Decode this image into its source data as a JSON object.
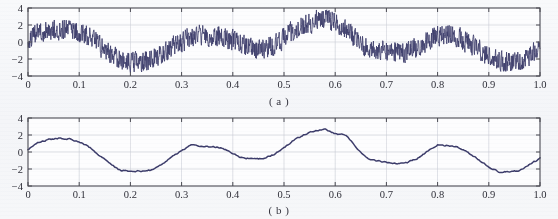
{
  "figure": {
    "background_color": "#f7f8fa",
    "line_color": "#3d3d6b",
    "grid_color": "#c9ccd4",
    "axis_color": "#4a4a52",
    "tick_label_color": "#2e2e38"
  },
  "panels": [
    {
      "id": "a",
      "caption": "( a )",
      "axes": {
        "x_ticks": [
          "0",
          "0.1",
          "0.2",
          "0.3",
          "0.4",
          "0.5",
          "0.6",
          "0.7",
          "0.8",
          "0.9",
          "1.0"
        ],
        "y_ticks": [
          "4",
          "2",
          "0",
          "-2",
          "-4"
        ],
        "xlim": [
          0,
          1
        ],
        "ylim": [
          -4,
          4
        ],
        "grid": true
      }
    },
    {
      "id": "b",
      "caption": "( b )",
      "axes": {
        "x_ticks": [
          "0",
          "0.1",
          "0.2",
          "0.3",
          "0.4",
          "0.5",
          "0.6",
          "0.7",
          "0.8",
          "0.9",
          "1.0"
        ],
        "y_ticks": [
          "4",
          "2",
          "0",
          "-2",
          "-4"
        ],
        "xlim": [
          0,
          1
        ],
        "ylim": [
          -4,
          4
        ],
        "grid": true
      }
    }
  ],
  "chart_data": [
    {
      "type": "line",
      "title": "( a )",
      "xlabel": "",
      "ylabel": "",
      "xlim": [
        0,
        1
      ],
      "ylim": [
        -4,
        4
      ],
      "grid": true,
      "legend": null,
      "xticks": [
        0,
        0.1,
        0.2,
        0.3,
        0.4,
        0.5,
        0.6,
        0.7,
        0.8,
        0.9,
        1.0
      ],
      "yticks": [
        -4,
        -2,
        0,
        2,
        4
      ],
      "series": [
        {
          "name": "noisy signal",
          "description": "Slow multi-hump oscillation with dense high-frequency noise of roughly +/-1.2 amplitude superimposed.",
          "baseline": {
            "x": [
              0.0,
              0.02,
              0.04,
              0.06,
              0.08,
              0.1,
              0.12,
              0.14,
              0.16,
              0.18,
              0.2,
              0.22,
              0.24,
              0.26,
              0.28,
              0.3,
              0.32,
              0.34,
              0.36,
              0.38,
              0.4,
              0.42,
              0.44,
              0.46,
              0.48,
              0.5,
              0.52,
              0.54,
              0.56,
              0.58,
              0.6,
              0.62,
              0.64,
              0.66,
              0.68,
              0.7,
              0.72,
              0.74,
              0.76,
              0.78,
              0.8,
              0.82,
              0.84,
              0.86,
              0.88,
              0.9,
              0.92,
              0.94,
              0.96,
              0.98,
              1.0
            ],
            "y": [
              0.35,
              1.15,
              1.45,
              1.55,
              1.6,
              1.25,
              0.55,
              -0.35,
              -1.35,
              -2.1,
              -2.3,
              -2.25,
              -2.2,
              -1.55,
              -0.7,
              0.1,
              0.6,
              0.75,
              0.7,
              0.55,
              0.15,
              -0.45,
              -0.75,
              -0.8,
              -0.4,
              0.45,
              1.35,
              2.05,
              2.45,
              2.6,
              2.35,
              1.55,
              0.35,
              -0.6,
              -0.95,
              -1.15,
              -1.3,
              -1.15,
              -0.7,
              0.1,
              0.75,
              0.85,
              0.55,
              -0.05,
              -0.85,
              -1.7,
              -2.25,
              -2.35,
              -2.15,
              -1.55,
              -0.85
            ]
          },
          "noise_amplitude": 1.2,
          "observed_min": -3.9,
          "observed_max": 3.9
        }
      ]
    },
    {
      "type": "line",
      "title": "( b )",
      "xlabel": "",
      "ylabel": "",
      "xlim": [
        0,
        1
      ],
      "ylim": [
        -4,
        4
      ],
      "grid": true,
      "legend": null,
      "xticks": [
        0,
        0.1,
        0.2,
        0.3,
        0.4,
        0.5,
        0.6,
        0.7,
        0.8,
        0.9,
        1.0
      ],
      "yticks": [
        -4,
        -2,
        0,
        2,
        4
      ],
      "series": [
        {
          "name": "denoised signal",
          "description": "Smooth multi-hump oscillation retaining only slight ripple; the denoised counterpart of panel (a).",
          "baseline": {
            "x": [
              0.0,
              0.02,
              0.04,
              0.06,
              0.08,
              0.1,
              0.12,
              0.14,
              0.16,
              0.18,
              0.2,
              0.22,
              0.24,
              0.26,
              0.28,
              0.3,
              0.32,
              0.34,
              0.36,
              0.38,
              0.4,
              0.42,
              0.44,
              0.46,
              0.48,
              0.5,
              0.52,
              0.54,
              0.56,
              0.58,
              0.6,
              0.62,
              0.64,
              0.66,
              0.68,
              0.7,
              0.72,
              0.74,
              0.76,
              0.78,
              0.8,
              0.82,
              0.84,
              0.86,
              0.88,
              0.9,
              0.92,
              0.94,
              0.96,
              0.98,
              1.0
            ],
            "y": [
              0.3,
              1.15,
              1.45,
              1.6,
              1.55,
              1.2,
              0.55,
              -0.4,
              -1.4,
              -2.15,
              -2.3,
              -2.25,
              -2.15,
              -1.5,
              -0.65,
              0.15,
              0.85,
              0.7,
              0.6,
              0.45,
              -0.25,
              -0.7,
              -0.8,
              -0.75,
              -0.3,
              0.55,
              1.4,
              2.05,
              2.5,
              2.65,
              2.15,
              2.05,
              0.6,
              -0.65,
              -1.05,
              -1.25,
              -1.4,
              -1.25,
              -0.75,
              0.1,
              0.85,
              0.75,
              0.55,
              -0.05,
              -0.9,
              -1.75,
              -2.35,
              -2.3,
              -2.2,
              -1.45,
              -0.75
            ]
          },
          "noise_amplitude": 0.12,
          "observed_min": -2.4,
          "observed_max": 2.7
        }
      ]
    }
  ]
}
